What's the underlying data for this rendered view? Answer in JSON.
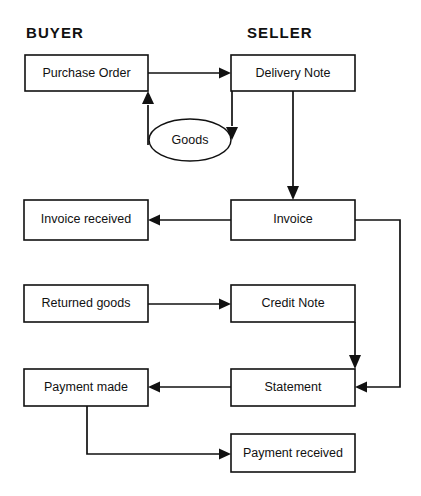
{
  "diagram": {
    "background_color": "#ffffff",
    "line_color": "#111111",
    "text_color": "#111111",
    "columns": [
      {
        "id": "buyer",
        "label": "BUYER"
      },
      {
        "id": "seller",
        "label": "SELLER"
      }
    ],
    "nodes": [
      {
        "id": "purchase-order",
        "label": "Purchase Order",
        "shape": "rect",
        "column": "buyer"
      },
      {
        "id": "delivery-note",
        "label": "Delivery Note",
        "shape": "rect",
        "column": "seller"
      },
      {
        "id": "goods",
        "label": "Goods",
        "shape": "ellipse",
        "column": "middle"
      },
      {
        "id": "invoice-received",
        "label": "Invoice received",
        "shape": "rect",
        "column": "buyer"
      },
      {
        "id": "invoice",
        "label": "Invoice",
        "shape": "rect",
        "column": "seller"
      },
      {
        "id": "returned-goods",
        "label": "Returned goods",
        "shape": "rect",
        "column": "buyer"
      },
      {
        "id": "credit-note",
        "label": "Credit Note",
        "shape": "rect",
        "column": "seller"
      },
      {
        "id": "payment-made",
        "label": "Payment made",
        "shape": "rect",
        "column": "buyer"
      },
      {
        "id": "statement",
        "label": "Statement",
        "shape": "rect",
        "column": "seller"
      },
      {
        "id": "payment-received",
        "label": "Payment received",
        "shape": "rect",
        "column": "seller"
      }
    ],
    "edges": [
      {
        "id": "po-to-dn",
        "from": "purchase-order",
        "to": "delivery-note",
        "label": ""
      },
      {
        "id": "dn-to-goods",
        "from": "delivery-note",
        "to": "goods",
        "label": ""
      },
      {
        "id": "goods-to-po",
        "from": "goods",
        "to": "purchase-order",
        "label": ""
      },
      {
        "id": "dn-to-invoice",
        "from": "delivery-note",
        "to": "invoice",
        "label": ""
      },
      {
        "id": "inv-to-invrec",
        "from": "invoice",
        "to": "invoice-received",
        "label": ""
      },
      {
        "id": "inv-to-stmt",
        "from": "invoice",
        "to": "statement",
        "label": ""
      },
      {
        "id": "rg-to-cn",
        "from": "returned-goods",
        "to": "credit-note",
        "label": ""
      },
      {
        "id": "cn-to-stmt",
        "from": "credit-note",
        "to": "statement",
        "label": ""
      },
      {
        "id": "stmt-to-pm",
        "from": "statement",
        "to": "payment-made",
        "label": ""
      },
      {
        "id": "pm-to-prec",
        "from": "payment-made",
        "to": "payment-received",
        "label": ""
      }
    ]
  }
}
